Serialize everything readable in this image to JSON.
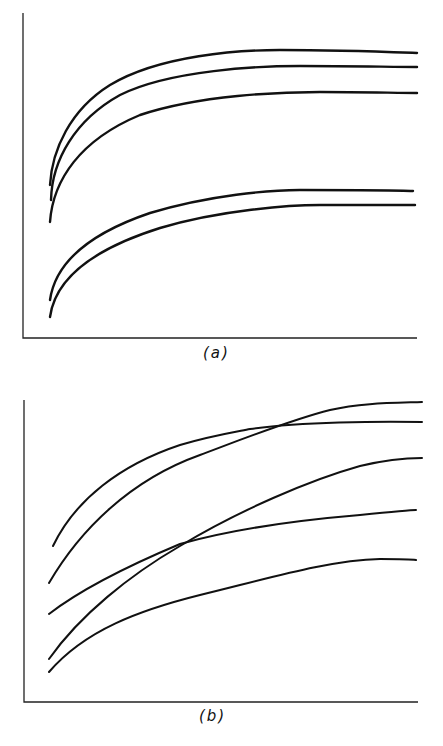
{
  "figure": {
    "panels": [
      {
        "label": "(a)"
      },
      {
        "label": "(b)"
      }
    ]
  },
  "chart_data": [
    {
      "type": "line",
      "title": "(a)",
      "xlabel": "",
      "ylabel": "",
      "grid": false,
      "legend": null,
      "axis_ticks": "none",
      "description": "Five monotonically increasing saturating curves; three upper curves close together, two lower curves close together; no crossings.",
      "x": [
        0,
        0.05,
        0.15,
        0.3,
        0.5,
        0.7,
        1.0
      ],
      "series": [
        {
          "name": "curve 1 (top)",
          "values": [
            0.55,
            0.68,
            0.78,
            0.84,
            0.87,
            0.88,
            0.88
          ]
        },
        {
          "name": "curve 2",
          "values": [
            0.51,
            0.63,
            0.73,
            0.79,
            0.82,
            0.83,
            0.84
          ]
        },
        {
          "name": "curve 3",
          "values": [
            0.44,
            0.55,
            0.65,
            0.71,
            0.74,
            0.75,
            0.76
          ]
        },
        {
          "name": "curve 4",
          "values": [
            0.14,
            0.26,
            0.35,
            0.41,
            0.44,
            0.45,
            0.46
          ]
        },
        {
          "name": "curve 5 (bottom)",
          "values": [
            0.08,
            0.2,
            0.3,
            0.37,
            0.4,
            0.41,
            0.41
          ]
        }
      ]
    },
    {
      "type": "line",
      "title": "(b)",
      "xlabel": "",
      "ylabel": "",
      "grid": false,
      "legend": null,
      "axis_ticks": "none",
      "description": "Five increasing curves with crossings: two upper curves cross near x~0.5; two middle curves cross near x~0.33.",
      "x": [
        0,
        0.15,
        0.33,
        0.5,
        0.7,
        1.0
      ],
      "series": [
        {
          "name": "curve A (starts high, ends 2nd)",
          "values": [
            0.52,
            0.69,
            0.78,
            0.83,
            0.86,
            0.87
          ]
        },
        {
          "name": "curve B (crosses A, ends top)",
          "values": [
            0.4,
            0.6,
            0.73,
            0.83,
            0.9,
            0.93
          ]
        },
        {
          "name": "curve C (ends 3rd)",
          "values": [
            0.09,
            0.28,
            0.46,
            0.6,
            0.71,
            0.8
          ]
        },
        {
          "name": "curve D (crosses C)",
          "values": [
            0.29,
            0.39,
            0.46,
            0.5,
            0.54,
            0.58
          ]
        },
        {
          "name": "curve E (bottom)",
          "values": [
            0.05,
            0.2,
            0.28,
            0.34,
            0.39,
            0.42
          ]
        }
      ]
    }
  ],
  "render": {
    "stroke": "#111111",
    "axis_stroke": "#222222",
    "panels": [
      {
        "axis": {
          "x0": 23,
          "y0": 338,
          "x1": 417,
          "ytop": 13
        },
        "paths": [
          "M50,185 C52,150 70,110 110,85 C160,55 240,50 280,50 C340,50 390,52 417,53",
          "M51,200 C52,160 75,120 120,95 C170,70 260,66 300,66 C350,66 395,67 417,67",
          "M50,222 C53,180 80,140 140,115 C200,95 280,92 320,92 C360,92 400,93 417,93",
          "M50,300 C55,265 85,235 150,213 C210,195 270,190 300,190 C350,190 395,190 413,191",
          "M50,317 C55,280 90,250 160,228 C220,210 290,205 320,205 C360,205 400,205 415,205"
        ]
      },
      {
        "axis": {
          "x0": 24,
          "y0": 702,
          "x1": 418,
          "ytop": 400
        },
        "paths": [
          "M53,546 C75,500 120,465 180,445 C210,436 235,432 250,429 C300,422 380,421 422,422",
          "M49,583 C80,530 130,480 200,455 C240,440 290,420 330,410 C360,403 390,403 422,402",
          "M49,659 C80,615 130,575 180,546 C240,510 310,480 360,466 C385,460 405,458 422,458",
          "M49,614 C80,590 130,565 180,544 C230,530 300,520 360,515 C390,512 410,510 416,510",
          "M49,672 C85,630 140,610 200,595 C270,578 330,560 380,559 C400,559 410,559 416,560"
        ]
      }
    ],
    "labels": [
      {
        "x": 203,
        "y": 344
      },
      {
        "x": 199,
        "y": 707
      }
    ]
  }
}
